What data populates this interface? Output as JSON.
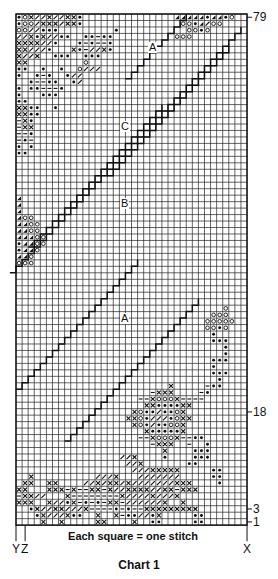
{
  "chart": {
    "title": "Chart 1",
    "legend_caption": "Each square = one stitch",
    "grid": {
      "columns": 38,
      "rows": 79,
      "left": 16,
      "top": 14,
      "cell_w": 6.08,
      "cell_h": 6.47
    },
    "row_labels": [
      {
        "row": 79,
        "text": "79"
      },
      {
        "row": 18,
        "text": "18"
      },
      {
        "row": 3,
        "text": "3"
      },
      {
        "row": 1,
        "text": "1"
      }
    ],
    "column_labels": [
      {
        "col": 0,
        "text": "Y"
      },
      {
        "col": 1,
        "text": "Z"
      },
      {
        "col": 38,
        "text": "X"
      }
    ],
    "section_labels": [
      {
        "text": "A",
        "x": 148,
        "y": 42
      },
      {
        "text": "C",
        "x": 120,
        "y": 121
      },
      {
        "text": "B",
        "x": 120,
        "y": 198
      },
      {
        "text": "A",
        "x": 120,
        "y": 313
      }
    ],
    "symbols": {
      "x": "cross",
      "o": "circle",
      "*": "dot",
      "/": "slash",
      "-": "dash",
      "t": "filled-triangle",
      ".": "empty"
    },
    "colors": {
      "ink": "#111111",
      "grid": "#222222",
      "paper": "#ffffff"
    },
    "pattern_rows_top_down": [
      "*ox//x//xx*...............ttttt*tt*o..",
      "*oo/xxx/xx*................oo*t/oo....",
      "oo//***.........*...........oo*o......",
      "//x*x//**..**-**..........ooo.........",
      "xxxx//*...*-*--*......................",
      "xx///*...x*-//x*......................",
      "x//x..***..***........................",
      "xx.........o..........................",
      "**..*..*..o///........................",
      "*..*-*..*//...........................",
      "..*--**..*/...........................",
      "*.**---*..............................",
      "*...***...............................",
      "**....................................",
      "xx**..*...............................",
      "xx**..................................",
      "-x*...................................",
      "-xx...................................",
      "--*...................................",
      "-*-...................................",
      "*.*...................................",
      "**....................................",
      "......................................",
      "......................................",
      "......................................",
      "......................................",
      "......................................",
      "......................................",
      "t.....................................",
      "t.....................................",
      "t.....................................",
      "too...................................",
      "ttoo..................................",
      "ttoo..................................",
      "tttoo.................................",
      "*ttoo.................................",
      "*tto..................................",
      "tto...................................",
      "ooo...................................",
      "......................................",
      "......................................",
      "......................................",
      "......................................",
      "......................................",
      "......................................",
      "..................................o...",
      "................................ooo...",
      "...............................ooooo..",
      "...............................oo*o...",
      "................................*.....",
      "................................***...",
      "..................................*...",
      "..................................*...",
      "................................***...",
      "................................*.....",
      "................................***...",
      ".................................*....",
      ".........................x.....-**....",
      "......................-xxx....-*......",
      "....................--xooox----.......",
      ".....................xx****xx.........",
      "...................xo**/**ox..........",
      "..................xxo*///*oxx.........",
      "...................xo*/**oox..........",
      ".....................x*****x..........",
      "....................--xooox--**.......",
      "......................-xxx..-..*......",
      "........................x....***......",
      ".................//x....*....***......",
      "..................//x.......**........",
      "...................///xxxxx.....**....",
      "..x..........///x...///////.....**....",
      ".xx..xx....//x/xx/x///////xxx....*....",
      "xx...xxx-x--xx-x//xxxx//xx-xxx........",
      "-xx//...x--------x////x///x...........",
      "xxx..x//*x-*-*-xx-//////x..x..........",
      "..*x//xx///x----*-*--xxxxxxxxx........",
      "...*x///x**..x..x-**//*x.....**.......",
      "....x..x.....xx....x..**.....**......."
    ]
  }
}
